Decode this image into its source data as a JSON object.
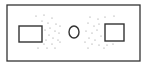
{
  "diagram": {
    "width": 149,
    "height": 65,
    "stroke_color": "#333333",
    "dot_color": "#8a8a8a",
    "background": "#ffffff",
    "outer_frame": {
      "x": 7,
      "y": 5,
      "w": 133,
      "h": 56
    },
    "left_box": {
      "x": 19,
      "y": 26,
      "w": 23,
      "h": 16
    },
    "right_box": {
      "x": 105,
      "y": 24,
      "w": 19,
      "h": 17
    },
    "center_circle": {
      "cx": 74,
      "cy": 32,
      "rx": 5,
      "ry": 6
    },
    "left_dots": [
      [
        36,
        16
      ],
      [
        44,
        15
      ],
      [
        52,
        18
      ],
      [
        42,
        21
      ],
      [
        48,
        23
      ],
      [
        56,
        24
      ],
      [
        60,
        26
      ],
      [
        50,
        28
      ],
      [
        45,
        30
      ],
      [
        55,
        31
      ],
      [
        59,
        33
      ],
      [
        49,
        35
      ],
      [
        53,
        38
      ],
      [
        46,
        40
      ],
      [
        58,
        40
      ],
      [
        44,
        44
      ],
      [
        52,
        44
      ],
      [
        38,
        48
      ],
      [
        47,
        48
      ],
      [
        55,
        48
      ],
      [
        60,
        42
      ]
    ],
    "right_dots": [
      [
        90,
        17
      ],
      [
        98,
        19
      ],
      [
        105,
        17
      ],
      [
        114,
        16
      ],
      [
        88,
        23
      ],
      [
        94,
        26
      ],
      [
        99,
        24
      ],
      [
        86,
        31
      ],
      [
        92,
        33
      ],
      [
        97,
        30
      ],
      [
        101,
        36
      ],
      [
        89,
        38
      ],
      [
        95,
        40
      ],
      [
        85,
        42
      ],
      [
        92,
        44
      ],
      [
        99,
        45
      ],
      [
        88,
        48
      ],
      [
        107,
        45
      ],
      [
        113,
        44
      ],
      [
        104,
        48
      ]
    ]
  }
}
